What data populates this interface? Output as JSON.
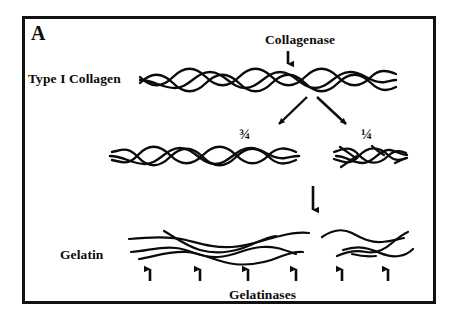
{
  "figure": {
    "panel_letter": "A",
    "caption_topic": "Collagen degradation pathway",
    "background_color": "#ffffff",
    "ink_color": "#0b0b0b",
    "border_color": "#111111",
    "labels": {
      "type_i_collagen": "Type I Collagen",
      "collagenase": "Collagenase",
      "gelatin": "Gelatin",
      "gelatinases": "Gelatinases",
      "three_quarters": "¾",
      "one_quarter": "¼"
    },
    "arrows": {
      "collagenase_down": {
        "name": "collagenase-cleavage-arrow",
        "direction": "down",
        "x": 288,
        "y_start": 52,
        "y_end": 69
      },
      "split_left": {
        "name": "fragment-split-arrow-left",
        "direction": "down-left",
        "x_start": 306,
        "y_start": 97,
        "x_end": 276,
        "y_end": 128
      },
      "split_right": {
        "name": "fragment-split-arrow-right",
        "direction": "down-right",
        "x_start": 316,
        "y_start": 97,
        "x_end": 349,
        "y_end": 128
      },
      "denature_down": {
        "name": "denaturation-arrow",
        "direction": "down",
        "x": 313,
        "y_start": 186,
        "y_end": 216
      },
      "gelatinase_up": {
        "name": "gelatinase-attack-arrows",
        "direction": "up",
        "count": 6,
        "x_positions": [
          150,
          200,
          248,
          296,
          342,
          388
        ],
        "y_start": 281,
        "y_end": 263
      }
    },
    "frame": {
      "x": 22,
      "y": 16,
      "width": 414,
      "height": 288,
      "stroke_width": 3
    },
    "molecules": {
      "collagen_triple_helix": {
        "name": "type-i-collagen-fibril",
        "x_start": 140,
        "x_end": 396,
        "y_center": 80,
        "strands": 3,
        "amplitude": 10,
        "period": 44
      },
      "fragment_three_quarters": {
        "name": "three-quarter-fragment",
        "x_start": 110,
        "x_end": 300,
        "y_center": 155,
        "strands": 3,
        "amplitude": 9,
        "period": 42
      },
      "fragment_one_quarter": {
        "name": "one-quarter-fragment",
        "x_start": 333,
        "x_end": 406,
        "y_center": 155,
        "strands": 3,
        "amplitude": 8,
        "period": 34
      },
      "gelatin_left": {
        "name": "gelatin-random-coils-left",
        "x_start": 128,
        "x_end": 306,
        "y_center": 243,
        "chains": 4
      },
      "gelatin_right": {
        "name": "gelatin-random-coils-right",
        "x_start": 320,
        "x_end": 412,
        "y_center": 243,
        "chains": 3
      }
    }
  }
}
